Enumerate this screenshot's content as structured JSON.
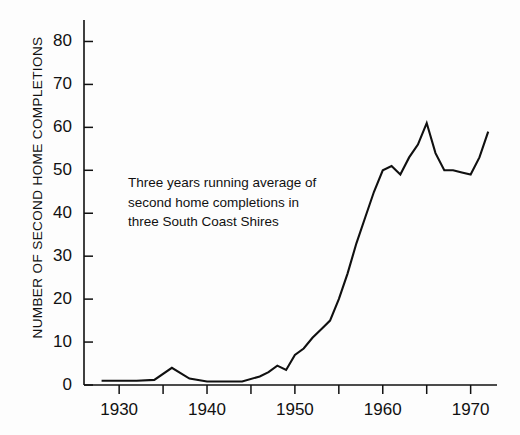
{
  "chart_data": {
    "type": "line",
    "title": "",
    "subtitle": "",
    "xlabel": "",
    "ylabel": "NUMBER OF SECOND HOME COMPLETIONS",
    "xlim": [
      1926,
      1973
    ],
    "ylim": [
      0,
      85
    ],
    "grid": false,
    "legend_position": "none",
    "x_ticks_major": [
      1930,
      1940,
      1950,
      1960,
      1970
    ],
    "x_tick_labels": [
      "1930",
      "1940",
      "1950",
      "1960",
      "1970"
    ],
    "x_ticks_minor": [
      1930,
      1935,
      1940,
      1945,
      1950,
      1955,
      1960,
      1965,
      1970
    ],
    "y_ticks": [
      0,
      10,
      20,
      30,
      40,
      50,
      60,
      70,
      80
    ],
    "y_tick_labels": [
      "0",
      "10",
      "20",
      "30",
      "40",
      "50",
      "60",
      "70",
      "80"
    ],
    "annotations": [
      {
        "lines": [
          "Three years running average of",
          "second home completions in",
          "three South Coast Shires"
        ],
        "x": 1931,
        "y": 47
      }
    ],
    "series": [
      {
        "name": "Three years running average of second home completions",
        "color": "#101010",
        "x": [
          1928,
          1930,
          1932,
          1934,
          1936,
          1938,
          1940,
          1942,
          1944,
          1946,
          1947,
          1948,
          1949,
          1950,
          1951,
          1952,
          1953,
          1954,
          1955,
          1956,
          1957,
          1958,
          1959,
          1960,
          1961,
          1962,
          1963,
          1964,
          1965,
          1966,
          1967,
          1968,
          1969,
          1970,
          1971,
          1972
        ],
        "values": [
          1,
          1,
          1,
          1.2,
          4,
          1.5,
          0.8,
          0.8,
          0.8,
          2,
          3,
          4.5,
          3.5,
          7,
          8.5,
          11,
          13,
          15,
          20,
          26,
          33,
          39,
          45,
          50,
          51,
          49,
          53,
          56,
          61,
          54,
          50,
          50,
          49.5,
          49,
          53,
          59
        ]
      }
    ]
  },
  "axis": {
    "y_label": "NUMBER OF SECOND HOME COMPLETIONS"
  }
}
